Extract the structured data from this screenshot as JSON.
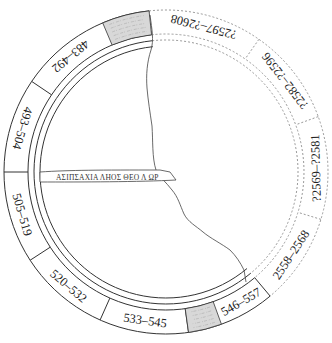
{
  "diagram": {
    "title": "",
    "center": [
      166,
      172
    ],
    "radii": {
      "outer": 162,
      "ring_inner": 138,
      "inner_a": 132,
      "inner_b": 126
    },
    "colors": {
      "line": "#333333",
      "dashed": "#999999",
      "fragment_fill": "#d8d8d8",
      "background": "#ffffff"
    },
    "segments": [
      {
        "label": "483–492",
        "start": -146,
        "end": -113,
        "style": "solid"
      },
      {
        "label": "493–504",
        "start": -180,
        "end": -146,
        "style": "solid"
      },
      {
        "label": "505–519",
        "start": 147,
        "end": 180,
        "style": "solid"
      },
      {
        "label": "520–532",
        "start": 114,
        "end": 147,
        "style": "solid"
      },
      {
        "label": "533–545",
        "start": 82,
        "end": 114,
        "style": "solid"
      },
      {
        "label": "546–557",
        "start": 50,
        "end": 70,
        "style": "solid"
      },
      {
        "label": "2558–2568",
        "start": 17,
        "end": 50,
        "style": "dashed"
      },
      {
        "label": "?2569–?2581",
        "start": -20,
        "end": 17,
        "style": "dashed"
      },
      {
        "label": "?2582–?2596",
        "start": -55,
        "end": -20,
        "style": "dashed"
      },
      {
        "label": "?2597–?2608",
        "start": -96,
        "end": -55,
        "style": "dashed"
      }
    ],
    "fragments": [
      {
        "name": "fragment-top",
        "start": -113,
        "end": -96
      },
      {
        "name": "fragment-bottom",
        "start": 70,
        "end": 82
      }
    ],
    "inscription": {
      "text": "ΑΣΠΙΣΑΧΙΛΛΗΟΣΘΕΟ ΛΩΡ",
      "display": "ΑΣΙΠΣΑΧΙΑ ΛΗΟΣ ΘΕΟ Λ ΩΡ"
    },
    "break_line": "irregular fracture line from top fragment down to bottom-right near 546–557"
  }
}
